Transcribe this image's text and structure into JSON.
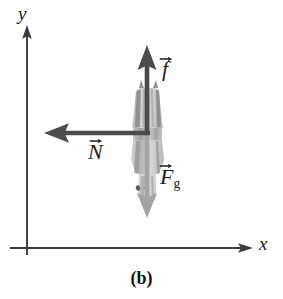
{
  "figure": {
    "caption": "(b)",
    "background_color": "#ffffff",
    "axes": {
      "x_label": "x",
      "y_label": "y",
      "axis_color": "#3a3a3a",
      "origin": {
        "x": 27,
        "y": 248
      }
    },
    "object": {
      "name": "shaded-object",
      "description": "grayscale object",
      "fill_color": "#b9b9b9"
    },
    "vectors": [
      {
        "id": "friction",
        "symbol": "f",
        "subscript": "",
        "label": "f",
        "direction": "up",
        "color": "#4c4c4c",
        "from": {
          "x": 147,
          "y": 133
        },
        "to": {
          "x": 147,
          "y": 48
        }
      },
      {
        "id": "normal",
        "symbol": "N",
        "subscript": "",
        "label": "N",
        "direction": "left",
        "color": "#4c4c4c",
        "from": {
          "x": 147,
          "y": 133
        },
        "to": {
          "x": 45,
          "y": 133
        }
      },
      {
        "id": "gravity",
        "symbol": "F",
        "subscript": "g",
        "label": "Fg",
        "direction": "down",
        "color": "#a0a0a0",
        "from": {
          "x": 147,
          "y": 133
        },
        "to": {
          "x": 147,
          "y": 216
        }
      }
    ]
  }
}
